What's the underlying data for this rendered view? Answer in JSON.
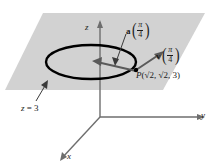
{
  "figure": {
    "background_color": "#ffffff",
    "plane_fill_color": "#d2d2d2",
    "curve_color": "#000000",
    "axis_color": "#6e6e6e",
    "vector_color": "#5a5a5a",
    "text_color": "#1a1a1a"
  },
  "axes": {
    "z_label": "z",
    "y_label": "y",
    "x_label": "x"
  },
  "plane": {
    "label_prefix": "z",
    "label_equals": "=",
    "label_value": "3",
    "label_full": "z = 3"
  },
  "vectors": {
    "acceleration": {
      "name": "a",
      "arg_numerator": "π",
      "arg_denominator": "4",
      "label_full": "a(π/4)"
    },
    "velocity": {
      "name": "v",
      "arg_numerator": "π",
      "arg_denominator": "4",
      "label_full": "v(π/4)"
    }
  },
  "point": {
    "name": "P",
    "open_paren": "(",
    "coord_x_radical": "√",
    "coord_x_radicand": "2",
    "sep1": ", ",
    "coord_y_radical": "√",
    "coord_y_radicand": "2",
    "sep2": ", ",
    "coord_z": "3",
    "close_paren": ")",
    "label_full": "P(√2, √2, 3)"
  }
}
